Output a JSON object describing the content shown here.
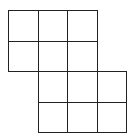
{
  "diagram": {
    "type": "grid-polyomino",
    "line_color": "#222222",
    "fill_color": "#ffffff",
    "cell_width": 29.5,
    "cell_height": 30.5,
    "origin": [
      8,
      10
    ],
    "cells": [
      {
        "row": 0,
        "col": 0
      },
      {
        "row": 0,
        "col": 1
      },
      {
        "row": 0,
        "col": 2
      },
      {
        "row": 1,
        "col": 0
      },
      {
        "row": 1,
        "col": 1
      },
      {
        "row": 1,
        "col": 2
      },
      {
        "row": 2,
        "col": 1
      },
      {
        "row": 2,
        "col": 2
      },
      {
        "row": 2,
        "col": 3
      },
      {
        "row": 3,
        "col": 1
      },
      {
        "row": 3,
        "col": 2
      },
      {
        "row": 3,
        "col": 3
      }
    ]
  }
}
